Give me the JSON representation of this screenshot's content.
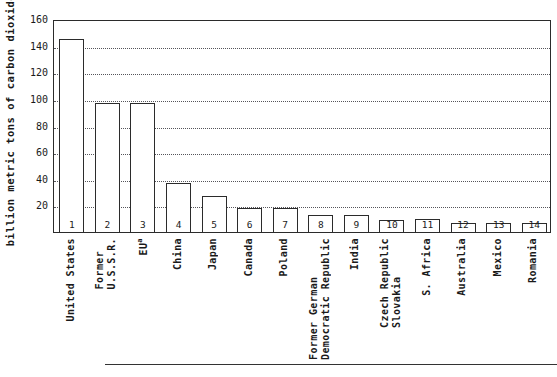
{
  "chart_data": {
    "type": "bar",
    "title": "",
    "xlabel": "",
    "ylabel": "billion metric tons of carbon dioxide",
    "ylim": [
      0,
      160
    ],
    "yticks": [
      20,
      40,
      60,
      80,
      100,
      120,
      140,
      160
    ],
    "grid": "horizontal-dotted",
    "legend": "none",
    "categories": [
      "United States",
      "Former\nU.S.S.R.",
      "EU",
      "China",
      "Japan",
      "Canada",
      "Poland",
      "Former German\nDemocratic Republic",
      "India",
      "Czech Republic\nSlovakia",
      "S. Africa",
      "Australia",
      "Mexico",
      "Romania"
    ],
    "category_superscripts": [
      "",
      "",
      "a",
      "",
      "",
      "",
      "",
      "",
      "",
      "",
      "",
      "",
      "",
      ""
    ],
    "bar_numbers": [
      "1",
      "2",
      "3",
      "4",
      "5",
      "6",
      "7",
      "8",
      "9",
      "10",
      "11",
      "12",
      "13",
      "14"
    ],
    "values": [
      145,
      97,
      97,
      37,
      27,
      18,
      18,
      13,
      13,
      9,
      10,
      7,
      7,
      7
    ]
  }
}
